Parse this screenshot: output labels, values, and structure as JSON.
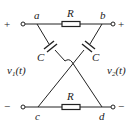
{
  "diagram": {
    "type": "lattice-network",
    "nodes": {
      "a": "a",
      "b": "b",
      "c": "c",
      "d": "d"
    },
    "components": {
      "top_resistor": "R",
      "bottom_resistor": "R",
      "left_capacitor": "C",
      "right_capacitor": "C"
    },
    "ports": {
      "input_voltage": {
        "v": "v",
        "sub": "1",
        "arg": "(t)"
      },
      "output_voltage": {
        "v": "v",
        "sub": "2",
        "arg": "(t)"
      },
      "input_plus": "+",
      "input_minus": "−",
      "output_plus": "+",
      "output_minus": "−"
    },
    "colors": {
      "line": "#222222",
      "background": "#ffffff"
    }
  }
}
